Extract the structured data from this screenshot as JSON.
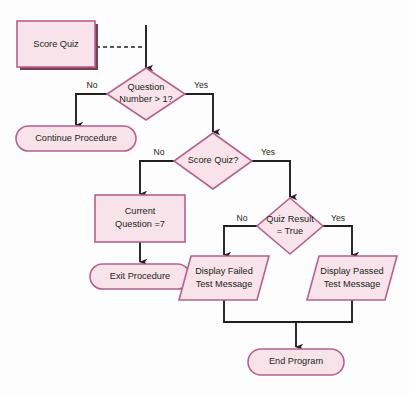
{
  "diagram": {
    "colors": {
      "shape_fill": "#f7e3e9",
      "shape_border": "#b4628b",
      "shape_shadow": "#7a3d58",
      "connector": "#231f20",
      "background": "#fdfdfd"
    },
    "nodes": [
      {
        "id": "score-quiz-start",
        "shape": "rectangle",
        "label_line1": "Score Quiz",
        "label_line2": ""
      },
      {
        "id": "question-number-check",
        "shape": "diamond",
        "label_line1": "Question",
        "label_line2": "Number > 1?"
      },
      {
        "id": "continue-procedure",
        "shape": "terminator",
        "label_line1": "Continue Procedure",
        "label_line2": ""
      },
      {
        "id": "score-quiz-check",
        "shape": "diamond",
        "label_line1": "Score Quiz?",
        "label_line2": ""
      },
      {
        "id": "current-question",
        "shape": "rectangle",
        "label_line1": "Current",
        "label_line2": "Question =7"
      },
      {
        "id": "quiz-result-check",
        "shape": "diamond",
        "label_line1": "Quiz Result",
        "label_line2": "= True"
      },
      {
        "id": "exit-procedure",
        "shape": "terminator",
        "label_line1": "Exit Procedure",
        "label_line2": ""
      },
      {
        "id": "display-failed",
        "shape": "parallelogram",
        "label_line1": "Display Failed",
        "label_line2": "Test Message"
      },
      {
        "id": "display-passed",
        "shape": "parallelogram",
        "label_line1": "Display Passed",
        "label_line2": "Test Message"
      },
      {
        "id": "end-program",
        "shape": "terminator",
        "label_line1": "End Program",
        "label_line2": ""
      }
    ],
    "edge_labels": {
      "q1_no": "No",
      "q1_yes": "Yes",
      "q2_no": "No",
      "q2_yes": "Yes",
      "q3_no": "No",
      "q3_yes": "Yes"
    }
  }
}
